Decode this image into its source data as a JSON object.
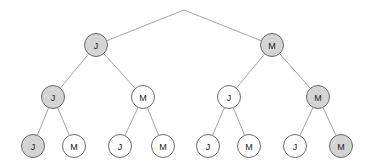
{
  "figure": {
    "type": "binary-decision-tree",
    "title": "",
    "width": 369,
    "height": 168,
    "background_color": "#ffffff"
  },
  "style": {
    "node_fill_highlighted": "#d4d4d4",
    "node_fill_default": "#ffffff",
    "node_stroke": "#595959",
    "edge_stroke": "#8c8c8c",
    "label_color": "#1a1a1a",
    "node_radius": 11.5
  },
  "apex": {
    "x": 184,
    "y": 10
  },
  "nodes": [
    {
      "id": "L1-left",
      "label": "J",
      "x": 96,
      "y": 45,
      "level": 1,
      "highlighted": true
    },
    {
      "id": "L1-right",
      "label": "M",
      "x": 272,
      "y": 45,
      "level": 1,
      "highlighted": true
    },
    {
      "id": "L2-a",
      "label": "J",
      "x": 53,
      "y": 97,
      "level": 2,
      "highlighted": true
    },
    {
      "id": "L2-b",
      "label": "M",
      "x": 143,
      "y": 97,
      "level": 2,
      "highlighted": false
    },
    {
      "id": "L2-c",
      "label": "J",
      "x": 229,
      "y": 97,
      "level": 2,
      "highlighted": false
    },
    {
      "id": "L2-d",
      "label": "M",
      "x": 318,
      "y": 97,
      "level": 2,
      "highlighted": true
    },
    {
      "id": "L3-1",
      "label": "J",
      "x": 33,
      "y": 146,
      "level": 3,
      "highlighted": true
    },
    {
      "id": "L3-2",
      "label": "M",
      "x": 74,
      "y": 146,
      "level": 3,
      "highlighted": false
    },
    {
      "id": "L3-3",
      "label": "J",
      "x": 120,
      "y": 146,
      "level": 3,
      "highlighted": false
    },
    {
      "id": "L3-4",
      "label": "M",
      "x": 163,
      "y": 146,
      "level": 3,
      "highlighted": false
    },
    {
      "id": "L3-5",
      "label": "J",
      "x": 208,
      "y": 146,
      "level": 3,
      "highlighted": false
    },
    {
      "id": "L3-6",
      "label": "M",
      "x": 249,
      "y": 146,
      "level": 3,
      "highlighted": false
    },
    {
      "id": "L3-7",
      "label": "J",
      "x": 295,
      "y": 146,
      "level": 3,
      "highlighted": false
    },
    {
      "id": "L3-8",
      "label": "M",
      "x": 341,
      "y": 146,
      "level": 3,
      "highlighted": true
    }
  ],
  "edges": [
    {
      "from": "apex",
      "to": "L1-left"
    },
    {
      "from": "apex",
      "to": "L1-right"
    },
    {
      "from": "L1-left",
      "to": "L2-a"
    },
    {
      "from": "L1-left",
      "to": "L2-b"
    },
    {
      "from": "L1-right",
      "to": "L2-c"
    },
    {
      "from": "L1-right",
      "to": "L2-d"
    },
    {
      "from": "L2-a",
      "to": "L3-1"
    },
    {
      "from": "L2-a",
      "to": "L3-2"
    },
    {
      "from": "L2-b",
      "to": "L3-3"
    },
    {
      "from": "L2-b",
      "to": "L3-4"
    },
    {
      "from": "L2-c",
      "to": "L3-5"
    },
    {
      "from": "L2-c",
      "to": "L3-6"
    },
    {
      "from": "L2-d",
      "to": "L3-7"
    },
    {
      "from": "L2-d",
      "to": "L3-8"
    }
  ]
}
